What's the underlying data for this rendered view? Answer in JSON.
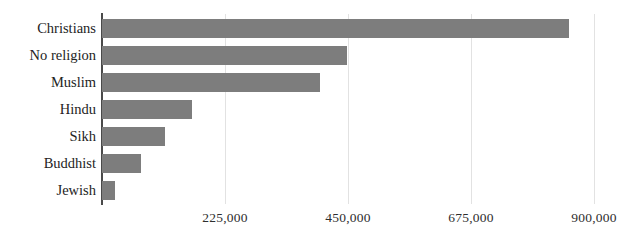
{
  "chart_data": {
    "type": "bar",
    "orientation": "horizontal",
    "title": "",
    "xlabel": "",
    "ylabel": "",
    "categories": [
      "Christians",
      "No religion",
      "Muslim",
      "Hindu",
      "Sikh",
      "Buddhist",
      "Jewish"
    ],
    "values": [
      855000,
      448000,
      399000,
      165000,
      115000,
      71000,
      24000
    ],
    "series": [
      {
        "name": "Population",
        "values": [
          855000,
          448000,
          399000,
          165000,
          115000,
          71000,
          24000
        ]
      }
    ],
    "xlim": [
      0,
      900000
    ],
    "xticks": [
      225000,
      450000,
      675000,
      900000
    ],
    "xticklabels": [
      "225,000",
      "450,000",
      "675,000",
      "900,000"
    ],
    "grid": "vertical-only",
    "legend": "none",
    "bar_color": "#7d7d7d",
    "gridline_color": "#e2e2e2",
    "axis_color": "#4a4a4a",
    "text_color": "#232323"
  }
}
